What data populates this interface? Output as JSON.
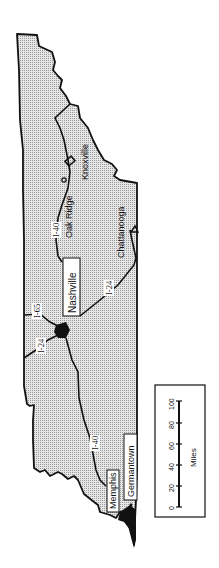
{
  "map": {
    "region": "Tennessee",
    "orientation": "rotated 90° clockwise (east at top)",
    "fill_color": "#d4d4d4",
    "border_color": "#111111",
    "background": "#ffffff"
  },
  "cities": [
    {
      "name": "Knoxville",
      "boxed": false
    },
    {
      "name": "Oak Ridge",
      "boxed": false
    },
    {
      "name": "Chattanooga",
      "boxed": false
    },
    {
      "name": "Nashville",
      "boxed": true
    },
    {
      "name": "Memphis",
      "boxed": true
    },
    {
      "name": "Germantown",
      "boxed": true
    }
  ],
  "highways": [
    {
      "name": "I-40"
    },
    {
      "name": "I-24"
    },
    {
      "name": "I-65"
    },
    {
      "name": "I-24"
    },
    {
      "name": "I-40"
    }
  ],
  "scale_bar": {
    "unit_label": "Miles",
    "ticks": [
      "0",
      "20",
      "40",
      "60",
      "80",
      "100"
    ]
  }
}
